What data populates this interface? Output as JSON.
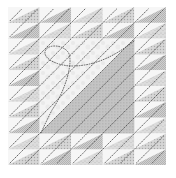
{
  "image": {
    "subject": "quilt-block",
    "description": "Square quilt with a 5x5 grid: 16 border blocks of stacked half-square triangles and a large central half-square triangle, quilted with dotted diagonal stitch lines and a looping stitch in the center.",
    "size": {
      "width": 176,
      "height": 178
    }
  },
  "layout": {
    "quilt_origin": [
      8,
      7
    ],
    "quilt_size": 158,
    "grid": 5,
    "cell_size": 31.6,
    "center_span": [
      1,
      3
    ]
  },
  "colors": {
    "background": "#ffffff",
    "light_fabric": "#f4f4f4",
    "mottled_light": "#eeeeee",
    "gray_fabric": "#cfcfcf",
    "gray_fabric_dark": "#bdbdbd",
    "dotted_pattern": "#a8a8a8",
    "stitch": "#555555",
    "center_dark": "#b8b8b8"
  },
  "stitching": {
    "style": "dotted",
    "direction": "lower-left to upper-right diagonals",
    "center_motif": "loop"
  }
}
